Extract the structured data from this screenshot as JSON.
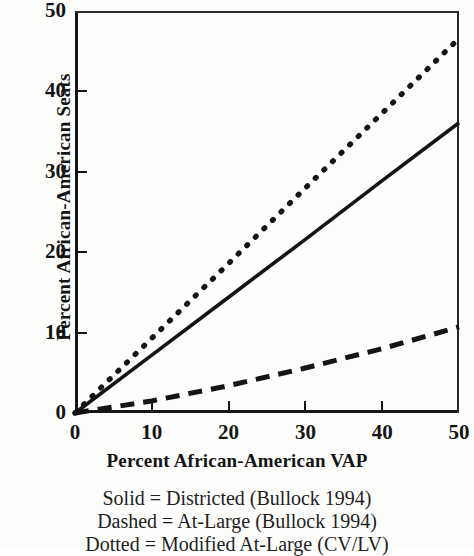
{
  "chart_data": {
    "type": "line",
    "title": "",
    "xlabel": "Percent African-American VAP",
    "ylabel": "Percent African-American Seats",
    "xlim": [
      0,
      50
    ],
    "ylim": [
      0,
      50
    ],
    "xticks": [
      "0",
      "10",
      "20",
      "30",
      "40",
      "50"
    ],
    "yticks": [
      "0",
      "10",
      "20",
      "30",
      "40",
      "50"
    ],
    "xtick_values": [
      0,
      10,
      20,
      30,
      40,
      50
    ],
    "ytick_values": [
      0,
      10,
      20,
      30,
      40,
      50
    ],
    "grid": false,
    "legend_position": "below-plot",
    "series": [
      {
        "name": "Districted (Bullock 1994)",
        "style": "solid",
        "color": "#141414",
        "x": [
          0,
          10,
          20,
          30,
          40,
          50
        ],
        "values": [
          0,
          7.2,
          14.4,
          21.6,
          28.9,
          36.1
        ]
      },
      {
        "name": "At-Large (Bullock 1994)",
        "style": "dashed",
        "color": "#141414",
        "x": [
          0,
          10,
          20,
          30,
          40,
          50
        ],
        "values": [
          0,
          1.5,
          3.4,
          5.6,
          8.0,
          10.7
        ]
      },
      {
        "name": "Modified At-Large (CV/LV)",
        "style": "dotted",
        "color": "#141414",
        "x": [
          0,
          10,
          20,
          30,
          40,
          50
        ],
        "values": [
          0,
          9.3,
          18.6,
          28.0,
          37.3,
          46.6
        ]
      }
    ]
  },
  "caption": {
    "lines": [
      "Solid = Districted (Bullock 1994)",
      "Dashed = At-Large (Bullock 1994)",
      "Dotted = Modified At-Large (CV/LV)"
    ]
  }
}
